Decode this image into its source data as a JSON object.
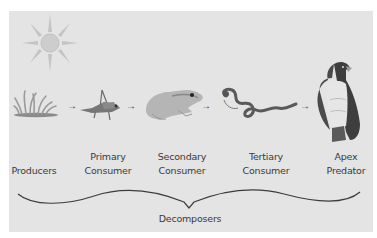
{
  "diagram": {
    "nodes": [
      {
        "id": "producers",
        "icon": "grass-icon",
        "label_line1": "",
        "label_line2": "Producers"
      },
      {
        "id": "primary-consumer",
        "icon": "grasshopper-icon",
        "label_line1": "Primary",
        "label_line2": "Consumer"
      },
      {
        "id": "secondary-consumer",
        "icon": "frog-icon",
        "label_line1": "Secondary",
        "label_line2": "Consumer"
      },
      {
        "id": "tertiary-consumer",
        "icon": "snake-icon",
        "label_line1": "Tertiary",
        "label_line2": "Consumer"
      },
      {
        "id": "apex-predator",
        "icon": "eagle-icon",
        "label_line1": "Apex",
        "label_line2": "Predator"
      }
    ],
    "edges": [
      {
        "from": "producers",
        "to": "primary-consumer",
        "glyph": "→"
      },
      {
        "from": "primary-consumer",
        "to": "secondary-consumer",
        "glyph": "→"
      },
      {
        "from": "secondary-consumer",
        "to": "tertiary-consumer",
        "glyph": "→"
      },
      {
        "from": "tertiary-consumer",
        "to": "apex-predator",
        "glyph": "→"
      }
    ],
    "energy_source": {
      "icon": "sun-icon"
    },
    "decomposers": {
      "label": "Decomposers",
      "bracket": "curly-brace"
    },
    "colors": {
      "background": "#e4e4e4",
      "text": "#3a3a3a",
      "sun": "#c8c8c8",
      "lines": "#3c3c3c"
    }
  }
}
